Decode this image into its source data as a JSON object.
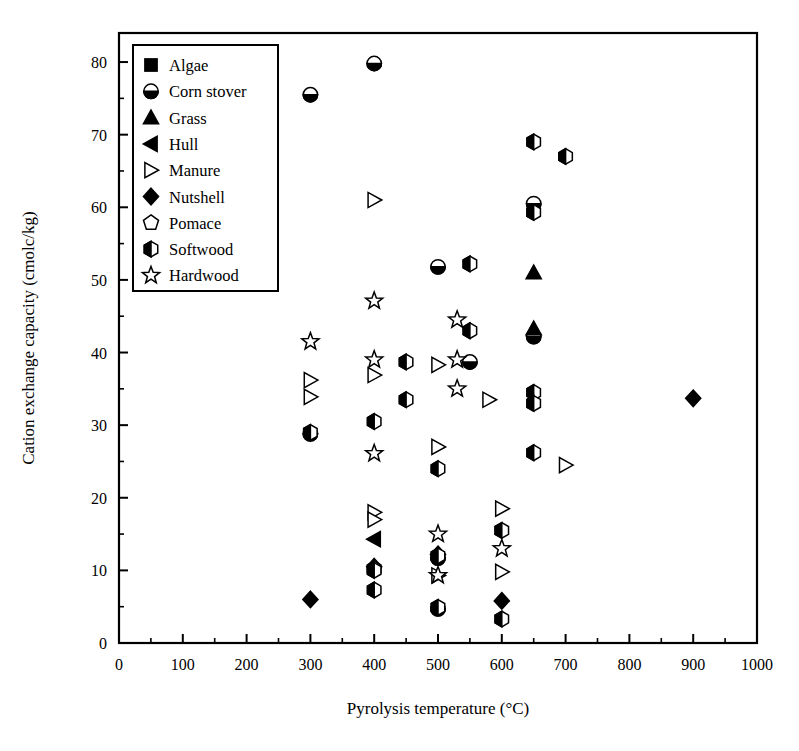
{
  "chart_data": {
    "type": "scatter",
    "title": "",
    "xlabel": "Pyrolysis temperature (°C)",
    "ylabel": "Cation exchange capacity (cmolc/kg)",
    "xlim": [
      0,
      1000
    ],
    "ylim": [
      0,
      84
    ],
    "x_major_ticks": [
      0,
      100,
      200,
      300,
      400,
      500,
      600,
      700,
      800,
      900,
      1000
    ],
    "x_tick_labels": [
      "0",
      "100",
      "200",
      "300",
      "400",
      "500",
      "600",
      "700",
      "800",
      "900",
      "1000"
    ],
    "x_minor_step": 50,
    "y_major_ticks": [
      0,
      10,
      20,
      30,
      40,
      50,
      60,
      70,
      80
    ],
    "y_tick_labels": [
      "0",
      "10",
      "20",
      "30",
      "40",
      "50",
      "60",
      "70",
      "80"
    ],
    "y_minor_step": 5,
    "grid": false,
    "legend_position": "top-left-inside",
    "series": [
      {
        "name": "Algae",
        "marker": "filled-square",
        "points": []
      },
      {
        "name": "Corn stover",
        "marker": "half-filled-circle",
        "points": [
          {
            "x": 300,
            "y": 75.5
          },
          {
            "x": 400,
            "y": 79.8
          },
          {
            "x": 300,
            "y": 28.8
          },
          {
            "x": 500,
            "y": 51.8
          },
          {
            "x": 550,
            "y": 38.7
          },
          {
            "x": 650,
            "y": 60.5
          },
          {
            "x": 650,
            "y": 42.2
          },
          {
            "x": 500,
            "y": 11.7
          },
          {
            "x": 500,
            "y": 4.7
          }
        ]
      },
      {
        "name": "Grass",
        "marker": "filled-triangle-up",
        "points": [
          {
            "x": 650,
            "y": 51.0
          },
          {
            "x": 650,
            "y": 43.3
          }
        ]
      },
      {
        "name": "Hull",
        "marker": "filled-triangle-left",
        "points": [
          {
            "x": 400,
            "y": 14.3
          }
        ]
      },
      {
        "name": "Manure",
        "marker": "open-triangle-right",
        "points": [
          {
            "x": 400,
            "y": 61.0
          },
          {
            "x": 300,
            "y": 36.2
          },
          {
            "x": 300,
            "y": 33.9
          },
          {
            "x": 400,
            "y": 36.9
          },
          {
            "x": 500,
            "y": 38.3
          },
          {
            "x": 580,
            "y": 33.5
          },
          {
            "x": 500,
            "y": 27.0
          },
          {
            "x": 700,
            "y": 24.5
          },
          {
            "x": 400,
            "y": 18.0
          },
          {
            "x": 400,
            "y": 17.0
          },
          {
            "x": 600,
            "y": 18.5
          },
          {
            "x": 500,
            "y": 9.3
          },
          {
            "x": 600,
            "y": 9.8
          }
        ]
      },
      {
        "name": "Nutshell",
        "marker": "filled-diamond",
        "points": [
          {
            "x": 900,
            "y": 33.7
          },
          {
            "x": 300,
            "y": 6.0
          },
          {
            "x": 400,
            "y": 10.5
          },
          {
            "x": 500,
            "y": 12.2
          },
          {
            "x": 600,
            "y": 5.8
          }
        ]
      },
      {
        "name": "Pomace",
        "marker": "open-pentagon",
        "points": []
      },
      {
        "name": "Softwood",
        "marker": "half-filled-hexagon",
        "points": [
          {
            "x": 650,
            "y": 69.0
          },
          {
            "x": 700,
            "y": 67.0
          },
          {
            "x": 650,
            "y": 59.3
          },
          {
            "x": 550,
            "y": 52.2
          },
          {
            "x": 550,
            "y": 43.0
          },
          {
            "x": 450,
            "y": 38.7
          },
          {
            "x": 450,
            "y": 33.5
          },
          {
            "x": 650,
            "y": 34.5
          },
          {
            "x": 650,
            "y": 33.0
          },
          {
            "x": 300,
            "y": 29.0
          },
          {
            "x": 400,
            "y": 30.5
          },
          {
            "x": 650,
            "y": 26.2
          },
          {
            "x": 500,
            "y": 24.0
          },
          {
            "x": 600,
            "y": 15.5
          },
          {
            "x": 400,
            "y": 10.2
          },
          {
            "x": 400,
            "y": 10.0
          },
          {
            "x": 500,
            "y": 12.0
          },
          {
            "x": 400,
            "y": 7.3
          },
          {
            "x": 500,
            "y": 4.9
          },
          {
            "x": 600,
            "y": 3.3
          }
        ]
      },
      {
        "name": "Hardwood",
        "marker": "open-star",
        "points": [
          {
            "x": 400,
            "y": 47.1
          },
          {
            "x": 530,
            "y": 44.5
          },
          {
            "x": 300,
            "y": 41.5
          },
          {
            "x": 400,
            "y": 39.0
          },
          {
            "x": 530,
            "y": 39.0
          },
          {
            "x": 530,
            "y": 35.0
          },
          {
            "x": 400,
            "y": 26.1
          },
          {
            "x": 500,
            "y": 15.0
          },
          {
            "x": 500,
            "y": 9.3
          },
          {
            "x": 600,
            "y": 13.0
          }
        ]
      }
    ],
    "legend": [
      {
        "label": "Algae",
        "marker": "filled-square"
      },
      {
        "label": "Corn stover",
        "marker": "half-filled-circle"
      },
      {
        "label": "Grass",
        "marker": "filled-triangle-up"
      },
      {
        "label": "Hull",
        "marker": "filled-triangle-left"
      },
      {
        "label": "Manure",
        "marker": "open-triangle-right"
      },
      {
        "label": "Nutshell",
        "marker": "filled-diamond"
      },
      {
        "label": "Pomace",
        "marker": "open-pentagon"
      },
      {
        "label": "Softwood",
        "marker": "half-filled-hexagon"
      },
      {
        "label": "Hardwood",
        "marker": "open-star"
      }
    ],
    "colors": {
      "ink": "#000000",
      "background": "#ffffff"
    }
  }
}
